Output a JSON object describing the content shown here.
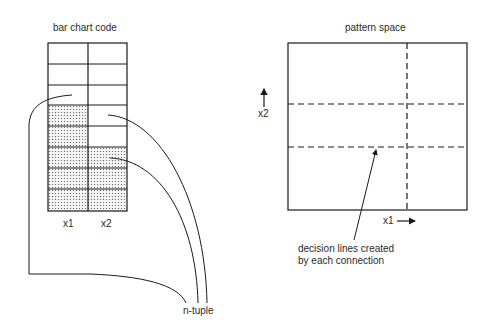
{
  "left_panel": {
    "title": "bar chart code",
    "column_labels": [
      "x1",
      "x2"
    ],
    "rows": 8,
    "shaded_rows_x1": [
      4,
      5,
      6,
      7,
      8
    ],
    "shaded_rows_x2": [
      6,
      7,
      8
    ],
    "output_label": "n-tuple"
  },
  "right_panel": {
    "title": "pattern space",
    "x_axis_label": "x1",
    "y_axis_label": "x2",
    "annotation_line1": "decision lines created",
    "annotation_line2": "by each connection"
  },
  "colors": {
    "line": "#1a1a1a",
    "dots": "#555555",
    "background": "#ffffff"
  }
}
